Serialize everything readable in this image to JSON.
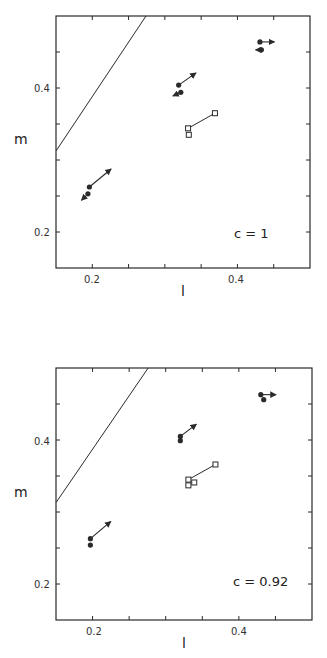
{
  "chart_data": [
    {
      "type": "scatter",
      "panel": "top",
      "annotation": "c = 1",
      "xlabel": "l",
      "ylabel": "m",
      "xlim": [
        0.15,
        0.5
      ],
      "ylim": [
        0.15,
        0.5
      ],
      "xticks": [
        0.15,
        0.2,
        0.25,
        0.3,
        0.35,
        0.4,
        0.45,
        0.5
      ],
      "xtick_labels": {
        "0.2": "0.2",
        "0.4": "0.4"
      },
      "yticks": [
        0.15,
        0.2,
        0.25,
        0.3,
        0.35,
        0.4,
        0.45,
        0.5
      ],
      "ytick_labels": {
        "0.2": "0.2",
        "0.4": "0.4"
      },
      "grid": false,
      "frame_px": {
        "x0": 56,
        "y0": 16,
        "x1": 310,
        "y1": 268
      },
      "reference_line": {
        "x": [
          0.15,
          0.274
        ],
        "y": [
          0.3125,
          0.5
        ]
      },
      "filled_points": [
        {
          "l": 0.196,
          "m": 0.2625,
          "arrow_to": [
            0.226,
            0.2875
          ]
        },
        {
          "l": 0.194,
          "m": 0.253,
          "arrow_to": [
            0.185,
            0.244
          ]
        },
        {
          "l": 0.319,
          "m": 0.404,
          "arrow_to": [
            0.343,
            0.421
          ]
        },
        {
          "l": 0.322,
          "m": 0.394,
          "arrow_to": [
            0.311,
            0.389
          ]
        },
        {
          "l": 0.431,
          "m": 0.464,
          "arrow_to": [
            0.451,
            0.464
          ]
        },
        {
          "l": 0.433,
          "m": 0.453,
          "arrow_to": [
            0.425,
            0.453
          ]
        }
      ],
      "open_squares": [
        {
          "l": 0.332,
          "m": 0.344
        },
        {
          "l": 0.333,
          "m": 0.335
        },
        {
          "l": 0.369,
          "m": 0.365
        }
      ],
      "square_links": [
        [
          0,
          2
        ]
      ]
    },
    {
      "type": "scatter",
      "panel": "bottom",
      "annotation": "c = 0.92",
      "xlabel": "l",
      "ylabel": "m",
      "xlim": [
        0.15,
        0.5
      ],
      "ylim": [
        0.15,
        0.5
      ],
      "xticks": [
        0.15,
        0.2,
        0.25,
        0.3,
        0.35,
        0.4,
        0.45,
        0.5
      ],
      "xtick_labels": {
        "0.2": "0.2",
        "0.4": "0.4"
      },
      "yticks": [
        0.15,
        0.2,
        0.25,
        0.3,
        0.35,
        0.4,
        0.45,
        0.5
      ],
      "ytick_labels": {
        "0.2": "0.2",
        "0.4": "0.4"
      },
      "grid": false,
      "frame_px": {
        "x0": 56,
        "y0": 38,
        "x1": 312,
        "y1": 290
      },
      "reference_line": {
        "x": [
          0.15,
          0.276
        ],
        "y": [
          0.313,
          0.5
        ]
      },
      "filled_points": [
        {
          "l": 0.197,
          "m": 0.263,
          "arrow_to": [
            0.225,
            0.287
          ]
        },
        {
          "l": 0.197,
          "m": 0.254,
          "arrow_to": null
        },
        {
          "l": 0.32,
          "m": 0.405,
          "arrow_to": [
            0.342,
            0.422
          ]
        },
        {
          "l": 0.32,
          "m": 0.399,
          "arrow_to": null
        },
        {
          "l": 0.43,
          "m": 0.463,
          "arrow_to": [
            0.451,
            0.463
          ]
        },
        {
          "l": 0.434,
          "m": 0.456,
          "arrow_to": null
        }
      ],
      "open_squares": [
        {
          "l": 0.331,
          "m": 0.345
        },
        {
          "l": 0.331,
          "m": 0.337
        },
        {
          "l": 0.339,
          "m": 0.341
        },
        {
          "l": 0.368,
          "m": 0.366
        }
      ],
      "square_links": [
        [
          0,
          3
        ]
      ]
    }
  ],
  "panels": {
    "top": {
      "annotation": "c = 1",
      "xlabel": "l",
      "ylabel": "m",
      "tick_02": "0.2",
      "tick_04": "0.4"
    },
    "bottom": {
      "annotation": "c = 0.92",
      "xlabel": "l",
      "ylabel": "m",
      "tick_02": "0.2",
      "tick_04": "0.4"
    }
  },
  "colors": {
    "ink": "#2a2a2a",
    "background": "#ffffff"
  }
}
